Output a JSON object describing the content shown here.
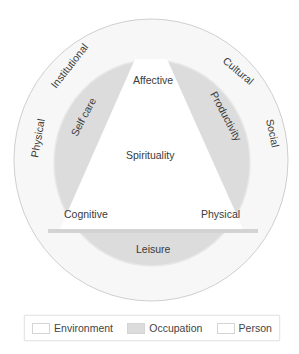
{
  "diagram": {
    "environment_labels": [
      "Physical",
      "Institutional",
      "Cultural",
      "Social"
    ],
    "occupation_labels": [
      "Self care",
      "Productivity",
      "Leisure"
    ],
    "person_labels": [
      "Affective",
      "Spirituality",
      "Cognitive",
      "Physical"
    ],
    "colors": {
      "environment": "#f7f7f7",
      "environment_border": "#d0d0d0",
      "occupation": "#dcdcdc",
      "person": "#ffffff",
      "bar": "#d3d3d3"
    }
  },
  "legend": {
    "items": [
      {
        "label": "Environment",
        "color": "#ffffff"
      },
      {
        "label": "Occupation",
        "color": "#dcdcdc"
      },
      {
        "label": "Person",
        "color": "#ffffff"
      }
    ]
  }
}
